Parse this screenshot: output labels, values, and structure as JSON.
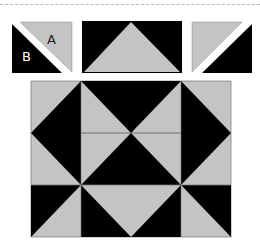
{
  "diagram": {
    "title": "",
    "colors": {
      "dark": "#000000",
      "light": "#c4c4c4",
      "gap": "#ffffff",
      "seam": "#555555"
    },
    "pieces": [
      {
        "id": "piece-1",
        "type": "half-square-triangle-unit",
        "labels": {
          "light": "A",
          "dark": "B"
        },
        "dark_side": "lower-left",
        "light_side": "upper-right",
        "separated": true
      },
      {
        "id": "piece-2",
        "type": "flying-geese-unit",
        "center": "light triangle pointing up",
        "corners": "dark"
      },
      {
        "id": "piece-3",
        "type": "half-square-triangle-unit",
        "dark_side": "lower-right",
        "light_side": "upper-left",
        "separated": true
      }
    ],
    "block": {
      "type": "assembled quilt block",
      "grid": "3 columns x 2 rows (center column of top row split into two flying-geese units)"
    },
    "labels": {
      "a": "A",
      "b": "B"
    }
  }
}
